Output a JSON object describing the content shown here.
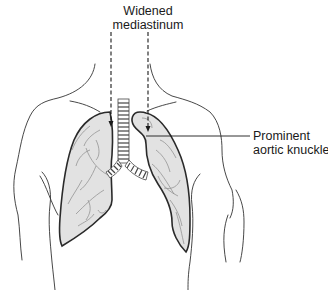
{
  "diagram": {
    "type": "anatomical-illustration",
    "labels": {
      "top": {
        "line1": "Widened",
        "line2": "mediastinum"
      },
      "right": {
        "line1": "Prominent",
        "line2": "aortic knuckle"
      }
    },
    "colors": {
      "outline": "#333333",
      "lung_fill": "#e2e2e2",
      "lung_border": "#2a2a2a",
      "vessels": "#8a8a8a",
      "text": "#1a1a1a",
      "background": "#ffffff"
    }
  }
}
